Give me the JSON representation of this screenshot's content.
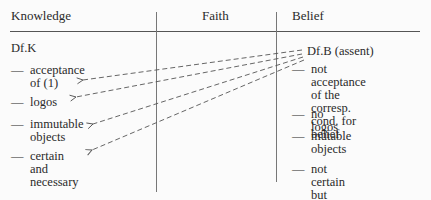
{
  "headers": {
    "knowledge": "Knowledge",
    "faith": "Faith",
    "belief": "Belief"
  },
  "knowledge": {
    "definition": "Df.K",
    "items": [
      {
        "dash": "—",
        "text": "acceptance\nof (1)"
      },
      {
        "dash": "—",
        "text": "logos"
      },
      {
        "dash": "—",
        "text": "immutable\nobjects"
      },
      {
        "dash": "—",
        "text": "certain and\nnecessary"
      }
    ]
  },
  "belief": {
    "definition": "Df.B (assent)",
    "items": [
      {
        "dash": "—",
        "text": "not acceptance\nof the corresp.\ncond. for belief"
      },
      {
        "dash": "—",
        "text": "no logos"
      },
      {
        "dash": "—",
        "text": "mutable\nobjects"
      },
      {
        "dash": "—",
        "text": "not certain but\ncontingent"
      }
    ]
  },
  "arrows": {
    "from": "Df.B (assent)",
    "to": [
      "acceptance of (1)",
      "logos",
      "immutable objects",
      "certain and necessary"
    ],
    "style": "dashed",
    "color": "#555555"
  }
}
